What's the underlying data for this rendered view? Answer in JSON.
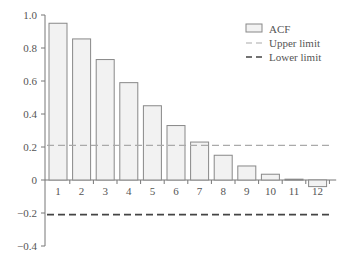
{
  "chart_data": {
    "type": "bar",
    "title": "",
    "xlabel": "",
    "ylabel": "",
    "categories": [
      "1",
      "2",
      "3",
      "4",
      "5",
      "6",
      "7",
      "8",
      "9",
      "10",
      "11",
      "12"
    ],
    "series": [
      {
        "name": "ACF",
        "values": [
          0.95,
          0.855,
          0.73,
          0.59,
          0.45,
          0.33,
          0.23,
          0.15,
          0.085,
          0.035,
          0.005,
          -0.04
        ]
      },
      {
        "name": "Upper limit",
        "values": [
          0.21,
          0.21,
          0.21,
          0.21,
          0.21,
          0.21,
          0.21,
          0.21,
          0.21,
          0.21,
          0.21,
          0.21
        ]
      },
      {
        "name": "Lower limit",
        "values": [
          -0.21,
          -0.21,
          -0.21,
          -0.21,
          -0.21,
          -0.21,
          -0.21,
          -0.21,
          -0.21,
          -0.21,
          -0.21,
          -0.21
        ]
      }
    ],
    "ylim": [
      -0.4,
      1.0
    ],
    "yticks": [
      "1.0",
      "0.8",
      "0.6",
      "0.4",
      "0.2",
      "0",
      "-0.2",
      "-0.4"
    ],
    "legend": {
      "position": "upper right",
      "entries": [
        "ACF",
        "Upper limit",
        "Lower limit"
      ]
    },
    "grid": false,
    "colors": {
      "bar_fill": "#f2f2f2",
      "bar_edge": "#888888",
      "upper": "#aaaaaa",
      "lower": "#444444"
    }
  }
}
